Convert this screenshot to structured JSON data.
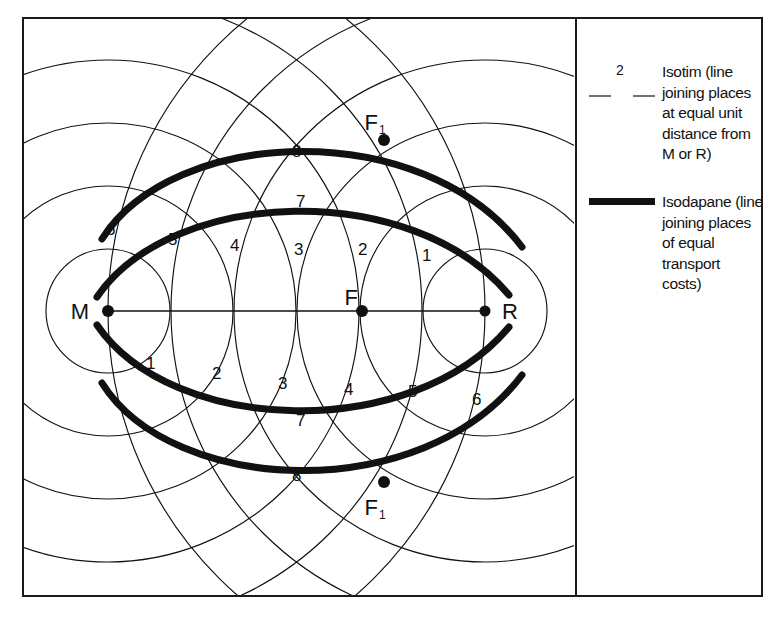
{
  "figure": {
    "type": "weber-least-cost-location-diagram"
  },
  "diagram": {
    "points": [
      {
        "id": "M",
        "label": "M",
        "label_side": "left",
        "x": 86,
        "y": 294,
        "description": "material source"
      },
      {
        "id": "F",
        "label": "F",
        "label_side": "above-left",
        "x": 340,
        "y": 294,
        "description": "least transport cost point"
      },
      {
        "id": "R",
        "label": "R",
        "label_side": "right",
        "x": 463,
        "y": 294,
        "description": "market"
      },
      {
        "id": "F1-top",
        "label": "F",
        "sub": "1",
        "label_side": "above",
        "x": 362,
        "y": 123,
        "description": "alternative location on 8 isodapane"
      },
      {
        "id": "F1-bottom",
        "label": "F",
        "sub": "1",
        "label_side": "below",
        "x": 362,
        "y": 465,
        "description": "alternative location on 8 isodapane"
      }
    ],
    "isotim_labels_upper": [
      "6",
      "5",
      "4",
      "3",
      "2",
      "1"
    ],
    "isotim_labels_lower": [
      "1",
      "2",
      "3",
      "4",
      "5",
      "6"
    ],
    "isodapane_labels_upper": [
      "8",
      "7"
    ],
    "isodapane_labels_lower": [
      "7",
      "8"
    ],
    "axis_label": ""
  },
  "legend": {
    "isotim": {
      "sample_number": "2",
      "text": "Isotim (line joining places at equal unit distance from M or R)"
    },
    "isodapane": {
      "text": "Isodapane (line joining places of equal transport costs)"
    }
  },
  "colors": {
    "ink": "#111111",
    "frame": "#1a1a1a",
    "background": "#ffffff"
  }
}
